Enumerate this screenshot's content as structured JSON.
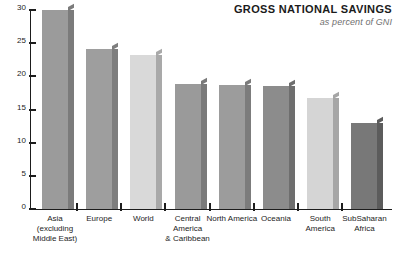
{
  "header": {
    "title": "GROSS NATIONAL SAVINGS",
    "subtitle": "as percent of GNI"
  },
  "chart_data": {
    "type": "bar",
    "title": "GROSS NATIONAL SAVINGS",
    "subtitle": "as percent of GNI",
    "xlabel": "",
    "ylabel": "",
    "ylim": [
      0,
      30
    ],
    "yticks": [
      0,
      5,
      10,
      15,
      20,
      25,
      30
    ],
    "ytick_labels": [
      "0",
      "5",
      "10",
      "15",
      "20",
      "25",
      "30"
    ],
    "grid": false,
    "legend": false,
    "categories": [
      "Asia\n(excluding\nMiddle East)",
      "Europe",
      "World",
      "Central\nAmerica\n& Caribbean",
      "North America",
      "Oceania",
      "South\nAmerica",
      "SubSaharan\nAfrica"
    ],
    "values": [
      30.0,
      24.1,
      23.2,
      18.8,
      18.7,
      18.6,
      16.8,
      12.9
    ],
    "bar_colors": [
      "#9b9b9b",
      "#9e9e9e",
      "#d9d9d9",
      "#9a9a9a",
      "#9c9c9c",
      "#8c8c8c",
      "#d5d5d5",
      "#787878"
    ],
    "bar_side_colors": [
      "#7b7b7b",
      "#7e7e7e",
      "#a9a9a9",
      "#7a7a7a",
      "#7c7c7c",
      "#6e6e6e",
      "#a6a6a6",
      "#5c5c5c"
    ],
    "axis_color": "#1d1d1d",
    "background": "#ffffff"
  }
}
